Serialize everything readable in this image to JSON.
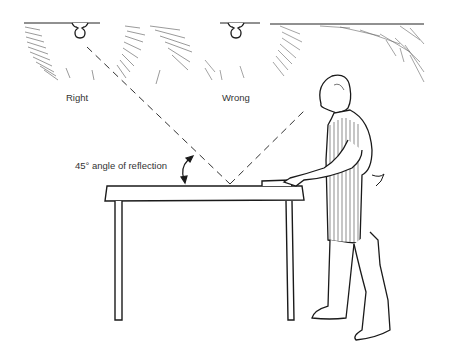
{
  "labels": {
    "right": "Right",
    "wrong": "Wrong",
    "angle": "45° angle of reflection"
  },
  "elements": {
    "light_right": "ceiling-light-bulb",
    "light_wrong": "ceiling-light-bulb",
    "table": "work-table",
    "person": "man-in-striped-apron",
    "reflection_lines": "dashed-light-rays"
  },
  "colors": {
    "ink": "#1a1a1a",
    "background": "#ffffff"
  }
}
